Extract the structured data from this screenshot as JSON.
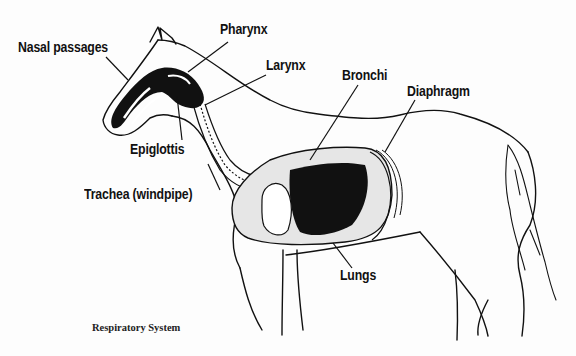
{
  "diagram": {
    "caption": "Respiratory System",
    "labels": {
      "nasal_passages": "Nasal passages",
      "pharynx": "Pharynx",
      "larynx": "Larynx",
      "epiglottis": "Epiglottis",
      "trachea": "Trachea (windpipe)",
      "bronchi": "Bronchi",
      "diaphragm": "Diaphragm",
      "lungs": "Lungs"
    },
    "colors": {
      "ink": "#111111",
      "background": "#fdfdfd"
    }
  }
}
